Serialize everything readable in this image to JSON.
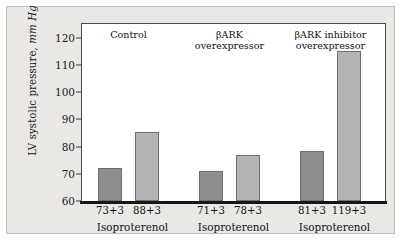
{
  "chart_data": {
    "type": "bar",
    "title": "",
    "xlabel": "",
    "ylabel": "LV systolic pressure, mm Hg",
    "ylabel_plain": "LV systolic pressure,",
    "ylabel_italic": "mm Hg",
    "ylim": [
      60,
      125
    ],
    "ytick_values": [
      60,
      70,
      80,
      90,
      100,
      110,
      120
    ],
    "ytick_labels": [
      "60",
      "70",
      "80",
      "90",
      "100",
      "110",
      "120"
    ],
    "grid": false,
    "legend": "none",
    "groups": [
      {
        "title": "Control",
        "title_lines": [
          "Control"
        ],
        "axis_label": "Isoproterenol",
        "bars": [
          {
            "label": "73+3",
            "value": 72.0,
            "series": "baseline"
          },
          {
            "label": "88+3",
            "value": 85.5,
            "series": "isoproterenol"
          }
        ]
      },
      {
        "title": "βARK overexpressor",
        "title_lines": [
          "βARK",
          "overexpressor"
        ],
        "axis_label": "Isoproterenol",
        "bars": [
          {
            "label": "71+3",
            "value": 71.0,
            "series": "baseline"
          },
          {
            "label": "78+3",
            "value": 77.0,
            "series": "isoproterenol"
          }
        ]
      },
      {
        "title": "βARK inhibitor overexpressor",
        "title_lines": [
          "βARK inhibitor",
          "overexpressor"
        ],
        "axis_label": "Isoproterenol",
        "bars": [
          {
            "label": "81+3",
            "value": 78.5,
            "series": "baseline"
          },
          {
            "label": "119+3",
            "value": 115.0,
            "series": "isoproterenol"
          }
        ]
      }
    ],
    "series": [
      {
        "name": "baseline",
        "values": [
          72.0,
          71.0,
          78.5
        ],
        "color": "#8e8e8e"
      },
      {
        "name": "isoproterenol",
        "values": [
          85.5,
          77.0,
          115.0
        ],
        "color": "#b4b4b4"
      }
    ],
    "categories": [
      "Control",
      "βARK overexpressor",
      "βARK inhibitor overexpressor"
    ]
  },
  "colors": {
    "panel_background": "#e9e8e5",
    "plot_background": "#ffffff",
    "axis": "#171717",
    "bar_baseline": "#8e8e8e",
    "bar_stim": "#b4b4b4",
    "bar_outline": "#6f6f6f",
    "text": "#111111"
  }
}
